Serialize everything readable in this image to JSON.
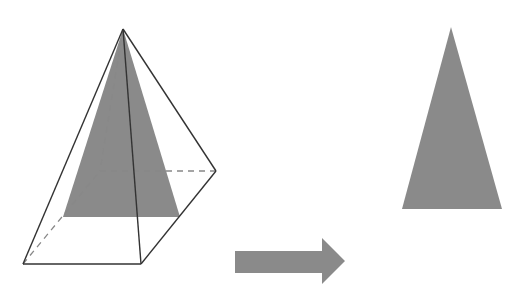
{
  "diagram": {
    "colors": {
      "background": "#ffffff",
      "edge": "#333333",
      "hidden_edge": "#888888",
      "fill": "#8a8a8a"
    },
    "pyramid": {
      "apex": [
        123,
        29
      ],
      "base_front_left": [
        23,
        264
      ],
      "base_front_right": [
        141,
        264
      ],
      "base_back_right": [
        216,
        171
      ],
      "base_back_left": [
        100,
        171
      ],
      "cross_section": {
        "apex": [
          123,
          29
        ],
        "base_left": [
          63,
          217
        ],
        "base_right": [
          180,
          217
        ]
      }
    },
    "arrow": {
      "direction": "right",
      "shaft": {
        "x1": 235,
        "x2": 322,
        "y_top": 251,
        "y_bottom": 273
      },
      "head": {
        "x": 322,
        "y_top": 238,
        "y_bottom": 284,
        "tip": [
          345,
          261
        ]
      }
    },
    "result_triangle": {
      "apex": [
        451,
        27
      ],
      "base_left": [
        402,
        209
      ],
      "base_right": [
        502,
        209
      ]
    }
  }
}
